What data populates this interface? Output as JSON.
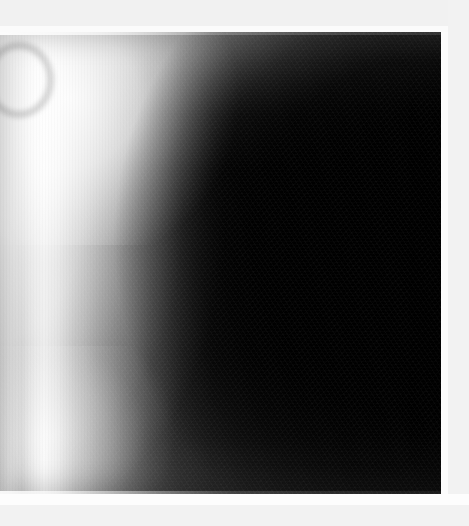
{
  "canvas": {
    "width": 469,
    "height": 526,
    "background_color": "#f2f2f2"
  },
  "image": {
    "kind": "grayscale-radiographic-photograph",
    "description": "Monochrome radiographic / medical imaging frame showing a large dark rounded mass occupying the right and central area, bounded on the left by bright banded crescents of soft tissue.",
    "alt_text": "Grayscale radiograph with bright left margin fading into a large black elliptical region",
    "color_mode": "grayscale",
    "plate": {
      "left": 0,
      "top": 32,
      "width": 442,
      "height": 462
    },
    "tones": {
      "brightest": "#fbfbfb",
      "light_gray": "#d6d6d6",
      "mid_gray": "#7c7c7c",
      "shadow_gray": "#353535",
      "near_black": "#0a0a0a",
      "darkest": "#020202"
    },
    "margins": {
      "top_band_color": "#f1f1f1",
      "top_band_height": 26,
      "bottom_band_color": "#f2f2f2",
      "bottom_band_height": 21,
      "right_band_color": "#f2f2f2",
      "right_band_width": 21,
      "inner_white_color": "#fcfcfc"
    },
    "features": [
      {
        "name": "upper-left-arc-artifact",
        "description": "Faint gray crescent arc near the top-left corner of the plate"
      },
      {
        "name": "bright-left-crescent",
        "description": "Broad bright banded crescent sweeping down the left third of the frame"
      },
      {
        "name": "central-dark-mass",
        "description": "Large near-black elliptical mass filling the right two-thirds"
      },
      {
        "name": "lower-left-light-patch",
        "description": "Soft lighter patch toward the bottom-left"
      },
      {
        "name": "diagonal-grain-texture",
        "description": "Faint diagonal striated film grain visible across the dark zones"
      }
    ]
  }
}
